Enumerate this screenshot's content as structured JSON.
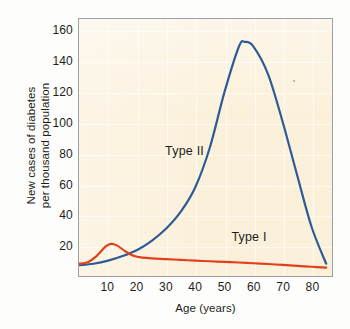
{
  "chart_data": {
    "type": "line",
    "title": "",
    "xlabel": "Age (years)",
    "ylabel": "New cases of diabetes per thousand population",
    "ylabel_lines": [
      "New cases of diabetes",
      "per thousand population"
    ],
    "xlim": [
      0,
      87
    ],
    "ylim": [
      0,
      168
    ],
    "xticks": [
      10,
      20,
      30,
      40,
      50,
      60,
      70,
      80
    ],
    "yticks": [
      20,
      40,
      60,
      80,
      100,
      120,
      140,
      160
    ],
    "xtick_labels": [
      "10",
      "20",
      "30",
      "40",
      "50",
      "60",
      "70",
      "80"
    ],
    "ytick_labels": [
      "20",
      "40",
      "60",
      "80",
      "100",
      "120",
      "140",
      "160"
    ],
    "grid": true,
    "legend_position": "inline-annotations",
    "background_color": "#fbf0d9",
    "series": [
      {
        "name": "Type II",
        "color": "#2d5b96",
        "label_x": 36,
        "label_y": 82,
        "x": [
          0,
          5,
          10,
          15,
          20,
          25,
          30,
          35,
          40,
          45,
          50,
          55,
          57,
          60,
          65,
          70,
          75,
          80,
          85
        ],
        "values": [
          7,
          8,
          10,
          13,
          17,
          23,
          31,
          42,
          58,
          84,
          120,
          150,
          153,
          150,
          132,
          101,
          66,
          32,
          8
        ]
      },
      {
        "name": "Type I",
        "color": "#e2401c",
        "label_x": 58,
        "label_y": 26,
        "x": [
          0,
          3,
          6,
          9,
          11,
          13,
          16,
          19,
          22,
          25,
          30,
          35,
          40,
          45,
          50,
          55,
          60,
          65,
          70,
          75,
          80,
          85
        ],
        "values": [
          8,
          9,
          13,
          19,
          21,
          20,
          16,
          13,
          12,
          11.5,
          11,
          10.5,
          10,
          9.6,
          9.2,
          8.8,
          8.3,
          7.8,
          7.2,
          6.6,
          6.0,
          5.4
        ]
      }
    ]
  }
}
